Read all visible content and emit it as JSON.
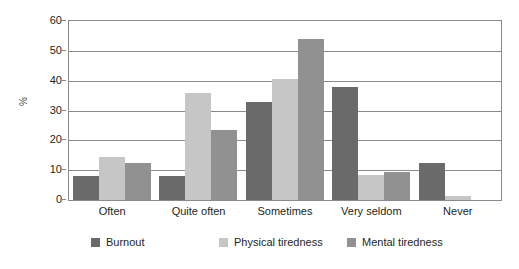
{
  "chart_data": {
    "type": "bar",
    "title": "",
    "subtitle": "",
    "xlabel": "",
    "ylabel": "%",
    "ylim": [
      0,
      60
    ],
    "yticks": [
      0,
      10,
      20,
      30,
      40,
      50,
      60
    ],
    "grid": true,
    "legend_position": "bottom",
    "categories": [
      "Often",
      "Quite often",
      "Sometimes",
      "Very seldom",
      "Never"
    ],
    "series": [
      {
        "name": "Burnout",
        "color": "#6a6a6a",
        "values": [
          8,
          8,
          33,
          38,
          12.5
        ]
      },
      {
        "name": "Physical tiredness",
        "color": "#c6c6c6",
        "values": [
          14.5,
          36,
          40.5,
          8.5,
          1.5
        ]
      },
      {
        "name": "Mental tiredness",
        "color": "#919191",
        "values": [
          12.5,
          23.5,
          54,
          9.5,
          0
        ]
      }
    ]
  }
}
